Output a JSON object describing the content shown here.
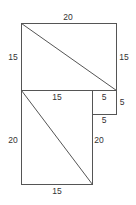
{
  "diagram": {
    "colors": {
      "line": "#555555",
      "text": "#333333",
      "background": "#ffffff"
    },
    "top_rectangle": {
      "top_label": "20",
      "left_label": "15",
      "right_label": "15",
      "has_diagonal": true
    },
    "lower_rectangle": {
      "top_label": "15",
      "left_label": "20",
      "right_label": "20",
      "bottom_label": "15",
      "has_diagonal": true
    },
    "small_square": {
      "top_label": "5",
      "right_label": "5",
      "bottom_label": "5"
    }
  }
}
